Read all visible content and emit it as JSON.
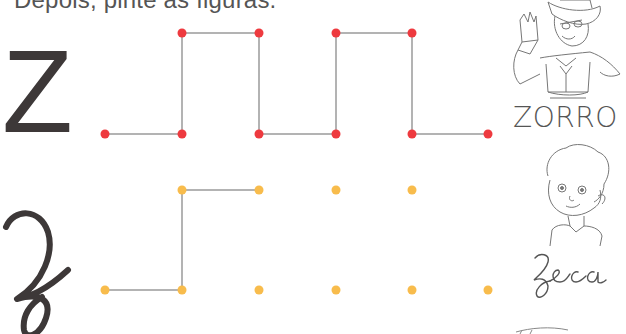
{
  "instruction": "Depois, pinte as figuras.",
  "rows": [
    {
      "letter_print": "Z",
      "word": "ZORRO",
      "dot_color": "#ee3a3f",
      "picture": "zorro-illustration",
      "dots": [
        [
          105,
          134
        ],
        [
          182,
          134
        ],
        [
          182,
          33
        ],
        [
          259,
          33
        ],
        [
          259,
          134
        ],
        [
          336,
          134
        ],
        [
          336,
          33
        ],
        [
          412,
          33
        ],
        [
          412,
          134
        ],
        [
          488,
          134
        ]
      ],
      "traced_path": [
        [
          105,
          134
        ],
        [
          182,
          134
        ],
        [
          182,
          33
        ],
        [
          259,
          33
        ],
        [
          259,
          134
        ],
        [
          336,
          134
        ],
        [
          336,
          33
        ],
        [
          412,
          33
        ],
        [
          412,
          134
        ],
        [
          488,
          134
        ]
      ]
    },
    {
      "letter_cursive": "z",
      "word": "Zeca",
      "dot_color": "#f8bc4c",
      "picture": "zeca-boy-illustration",
      "dots": [
        [
          105,
          290
        ],
        [
          182,
          290
        ],
        [
          182,
          190
        ],
        [
          259,
          190
        ],
        [
          259,
          290
        ],
        [
          336,
          190
        ],
        [
          336,
          290
        ],
        [
          412,
          190
        ],
        [
          412,
          290
        ],
        [
          488,
          290
        ]
      ],
      "traced_path": [
        [
          105,
          290
        ],
        [
          182,
          290
        ],
        [
          182,
          190
        ],
        [
          259,
          190
        ]
      ]
    }
  ],
  "colors": {
    "line": "#9a9a9a",
    "text": "#555555",
    "letter": "#3d3838"
  }
}
